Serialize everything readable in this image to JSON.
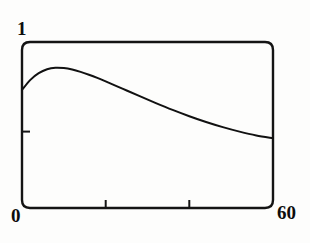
{
  "figure": {
    "name": "line-plot",
    "background_color": "#fdfdfc",
    "ink_color": "#111111"
  },
  "labels": {
    "y_max": "1",
    "x_min": "0",
    "x_max": "60"
  },
  "chart_data": {
    "type": "line",
    "title": "",
    "xlabel": "",
    "ylabel": "",
    "xlim": [
      0,
      60
    ],
    "ylim": [
      0,
      1
    ],
    "grid": false,
    "legend": null,
    "axis_style": "rounded-rectangle-frame",
    "xticks": [
      0,
      20,
      40,
      60
    ],
    "xtick_labels": [
      "0",
      "",
      "",
      "60"
    ],
    "yticks": [
      0,
      0.46,
      1
    ],
    "ytick_labels": [
      "0",
      "",
      "1"
    ],
    "series": [
      {
        "name": "curve",
        "color": "#111111",
        "line_width": 2,
        "x": [
          0,
          2,
          4,
          6,
          8,
          10,
          12,
          14,
          16,
          18,
          20,
          24,
          28,
          32,
          36,
          40,
          44,
          48,
          52,
          56,
          60
        ],
        "y": [
          0.711,
          0.772,
          0.812,
          0.836,
          0.845,
          0.843,
          0.834,
          0.82,
          0.803,
          0.784,
          0.763,
          0.719,
          0.675,
          0.632,
          0.591,
          0.553,
          0.518,
          0.487,
          0.46,
          0.437,
          0.42
        ]
      }
    ],
    "annotations": []
  }
}
